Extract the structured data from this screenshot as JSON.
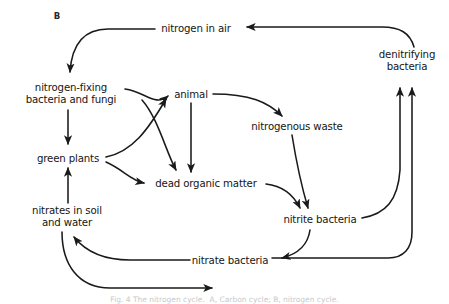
{
  "figure": {
    "panel_letter": "B",
    "caption": "Fig. 4 The nitrogen cycle.  A, Carbon cycle; B, nitrogen cycle."
  },
  "nodes": [
    {
      "id": "nitrogen_in_air",
      "label": "nitrogen in air",
      "x": 196,
      "y": 29
    },
    {
      "id": "denitrifying_bacteria",
      "label": "denitrifying\nbacteria",
      "x": 407,
      "y": 61
    },
    {
      "id": "nitrogen_fixing",
      "label": "nitrogen-fixing\nbacteria and fungi",
      "x": 71,
      "y": 94
    },
    {
      "id": "animal",
      "label": "animal",
      "x": 191,
      "y": 95
    },
    {
      "id": "nitrogenous_waste",
      "label": "nitrogenous waste",
      "x": 297,
      "y": 127
    },
    {
      "id": "green_plants",
      "label": "green plants",
      "x": 68,
      "y": 159
    },
    {
      "id": "dead_organic_matter",
      "label": "dead organic matter",
      "x": 206,
      "y": 184
    },
    {
      "id": "nitrates_in_soil",
      "label": "nitrates in soil\nand water",
      "x": 67,
      "y": 217
    },
    {
      "id": "nitrite_bacteria",
      "label": "nitrite bacteria",
      "x": 320,
      "y": 220
    },
    {
      "id": "nitrate_bacteria",
      "label": "nitrate bacteria",
      "x": 230,
      "y": 261
    }
  ],
  "edges": [
    {
      "id": "edge-nitrogen-air-to-fixing",
      "from": "nitrogen in air",
      "to": "nitrogen-fixing bacteria and fungi"
    },
    {
      "id": "edge-denitrifying-to-nitrogen-air",
      "from": "denitrifying bacteria",
      "to": "nitrogen in air"
    },
    {
      "id": "edge-fixing-to-green-plants",
      "from": "nitrogen-fixing bacteria and fungi",
      "to": "green plants"
    },
    {
      "id": "edge-fixing-to-animal",
      "from": "nitrogen-fixing bacteria and fungi",
      "to": "animal"
    },
    {
      "id": "edge-green-plants-to-animal",
      "from": "green plants",
      "to": "animal"
    },
    {
      "id": "edge-green-plants-to-dead-organic",
      "from": "green plants",
      "to": "dead organic matter"
    },
    {
      "id": "edge-animal-to-dead-organic",
      "from": "animal",
      "to": "dead organic matter"
    },
    {
      "id": "edge-animal-to-nitrogenous-waste",
      "from": "animal",
      "to": "nitrogenous waste"
    },
    {
      "id": "edge-nitrogenous-waste-to-nitrite",
      "from": "nitrogenous waste",
      "to": "nitrite bacteria"
    },
    {
      "id": "edge-dead-organic-to-nitrite",
      "from": "dead organic matter",
      "to": "nitrite bacteria"
    },
    {
      "id": "edge-nitrite-to-nitrate-bacteria",
      "from": "nitrite bacteria",
      "to": "nitrate bacteria"
    },
    {
      "id": "edge-nitrate-bacteria-to-nitrates-soil",
      "from": "nitrate bacteria",
      "to": "nitrates in soil and water"
    },
    {
      "id": "edge-nitrates-soil-to-green-plants",
      "from": "nitrates in soil and water",
      "to": "green plants"
    },
    {
      "id": "edge-nitrite-to-denitrifying",
      "from": "nitrite bacteria",
      "to": "denitrifying bacteria"
    },
    {
      "id": "edge-nitrate-to-denitrifying",
      "from": "nitrate bacteria",
      "to": "denitrifying bacteria"
    },
    {
      "id": "edge-nitrates-soil-to-nitrate-bacteria",
      "from": "nitrates in soil and water",
      "to": "nitrate bacteria (bottom loop)"
    }
  ],
  "style": {
    "stroke_color": "#1a1a1a",
    "background": "#ffffff",
    "text_color": "#151515"
  }
}
